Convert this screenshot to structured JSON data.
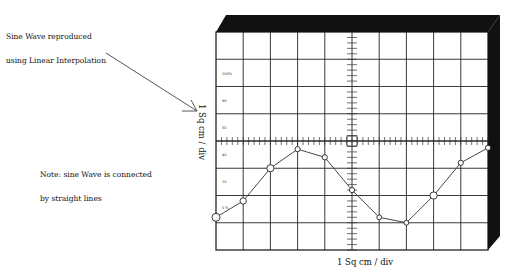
{
  "annotations": {
    "title_line1": "Sine Wave reproduced",
    "title_line2": "using Linear Interpolation",
    "note_line1": "Note: sine Wave is connected",
    "note_line2": "by straight lines"
  },
  "axes": {
    "ylabel": "1 Sq cm / div",
    "xlabel": "1 Sq cm / div",
    "left_ticks": [
      "100%",
      "90",
      "50",
      "40",
      "10",
      "0 %"
    ]
  },
  "chart_data": {
    "type": "line",
    "title": "Sine Wave reproduced using Linear Interpolation",
    "xlabel": "1 Sq cm / div",
    "ylabel": "1 Sq cm / div",
    "grid": true,
    "grid_divisions": {
      "x": 10,
      "y": 8
    },
    "x": [
      0,
      1,
      2,
      3,
      4,
      5,
      6,
      7,
      8,
      9,
      10
    ],
    "y": [
      -2.8,
      -2.2,
      -1.0,
      -0.3,
      -0.6,
      -1.8,
      -2.8,
      -3.0,
      -2.0,
      -0.8,
      -0.25
    ],
    "marker": "circle",
    "note": "Values in grid divisions relative to the horizontal center axis (positive up)"
  },
  "colors": {
    "frame": "#111111",
    "grid": "#222222",
    "trace": "#333333"
  }
}
